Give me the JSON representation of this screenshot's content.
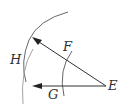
{
  "diagram": {
    "labels": {
      "E": "E",
      "F": "F",
      "G": "G",
      "H": "H"
    },
    "colors": {
      "line": "#333333",
      "arc": "#555555",
      "light_arc": "#999999"
    }
  }
}
